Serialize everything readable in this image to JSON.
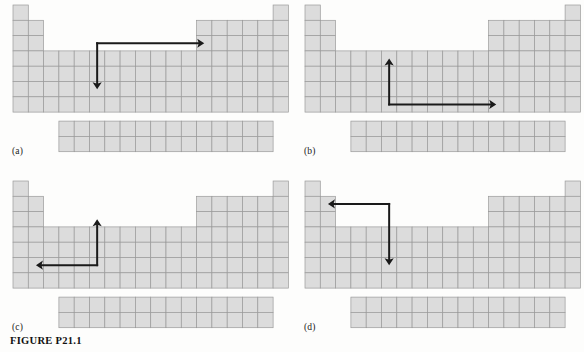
{
  "figure": {
    "caption": "FIGURE P21.1",
    "width": 584,
    "height": 352
  },
  "style": {
    "cell_fill": "#dcdcdc",
    "cell_stroke": "#9a9a9a",
    "block_outline": "#8e8e8e",
    "arrow_color": "#1a1a1a",
    "page_background": "#fdfdfc"
  },
  "chart_data": {
    "type": "diagram",
    "title": "FIGURE P21.1",
    "grid": {
      "columns": 18,
      "rows": 7,
      "cell_width": 15.3,
      "cell_height": 15.3,
      "column_row_spans": [
        {
          "column": 1,
          "start_row": 1,
          "end_row": 7
        },
        {
          "column": 2,
          "start_row": 2,
          "end_row": 7
        },
        {
          "column": 3,
          "start_row": 4,
          "end_row": 7
        },
        {
          "column": 4,
          "start_row": 4,
          "end_row": 7
        },
        {
          "column": 5,
          "start_row": 4,
          "end_row": 7
        },
        {
          "column": 6,
          "start_row": 4,
          "end_row": 7
        },
        {
          "column": 7,
          "start_row": 4,
          "end_row": 7
        },
        {
          "column": 8,
          "start_row": 4,
          "end_row": 7
        },
        {
          "column": 9,
          "start_row": 4,
          "end_row": 7
        },
        {
          "column": 10,
          "start_row": 4,
          "end_row": 7
        },
        {
          "column": 11,
          "start_row": 4,
          "end_row": 7
        },
        {
          "column": 12,
          "start_row": 4,
          "end_row": 7
        },
        {
          "column": 13,
          "start_row": 2,
          "end_row": 7
        },
        {
          "column": 14,
          "start_row": 2,
          "end_row": 7
        },
        {
          "column": 15,
          "start_row": 2,
          "end_row": 7
        },
        {
          "column": 16,
          "start_row": 2,
          "end_row": 7
        },
        {
          "column": 17,
          "start_row": 2,
          "end_row": 7
        },
        {
          "column": 18,
          "start_row": 1,
          "end_row": 7
        }
      ],
      "f_block": {
        "columns": 14,
        "rows": 2,
        "start_column_offset": 3
      }
    }
  },
  "panels": [
    {
      "id": "a",
      "label": "(a)",
      "arrow": {
        "description": "right-angle arrow rising from a corner, with one head pointing right and one head pointing down",
        "corner_column": 6,
        "corner_row": 3,
        "heads": [
          "right",
          "down"
        ],
        "head_right_end_column": 13,
        "head_down_end_row": 6
      }
    },
    {
      "id": "b",
      "label": "(b)",
      "arrow": {
        "description": "right-angle arrow from a corner, with one head pointing up and one head pointing right",
        "corner_column": 6,
        "corner_row": 7,
        "heads": [
          "up",
          "right"
        ],
        "head_up_end_row": 4,
        "head_right_end_column": 13
      }
    },
    {
      "id": "c",
      "label": "(c)",
      "arrow": {
        "description": "right-angle arrow from a corner, with one head pointing up and one head pointing left",
        "corner_column": 6,
        "corner_row": 6,
        "heads": [
          "up",
          "left"
        ],
        "head_up_end_row": 3,
        "head_left_end_column": 2
      }
    },
    {
      "id": "d",
      "label": "(d)",
      "arrow": {
        "description": "right-angle arrow from a corner, with one head pointing left and one head pointing down",
        "corner_column": 6,
        "corner_row": 2,
        "heads": [
          "left",
          "down"
        ],
        "head_left_end_column": 2,
        "head_down_end_row": 6
      }
    }
  ]
}
